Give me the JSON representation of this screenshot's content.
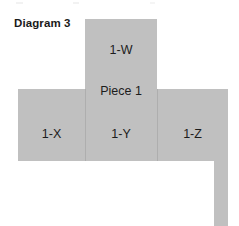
{
  "diagram": {
    "title": "Diagram 3",
    "piece_label": "Piece 1",
    "fill_color": "#c0c0c0",
    "divider_color": "#aeaeae",
    "text_color": "#1c1c1c",
    "background_color": "#ffffff",
    "cells": [
      {
        "id": "w",
        "label": "1-W",
        "x": 85,
        "y": 19,
        "width": 72,
        "height": 70
      },
      {
        "id": "x",
        "label": "1-X",
        "x": 18,
        "y": 89,
        "width": 67,
        "height": 72
      },
      {
        "id": "y",
        "label": "1-Y",
        "x": 85,
        "y": 89,
        "width": 72,
        "height": 72
      },
      {
        "id": "z",
        "label": "1-Z",
        "x": 157,
        "y": 89,
        "width": 71,
        "height": 72
      },
      {
        "id": "tab",
        "label": "",
        "x": 214,
        "y": 161,
        "width": 14,
        "height": 65
      }
    ]
  }
}
